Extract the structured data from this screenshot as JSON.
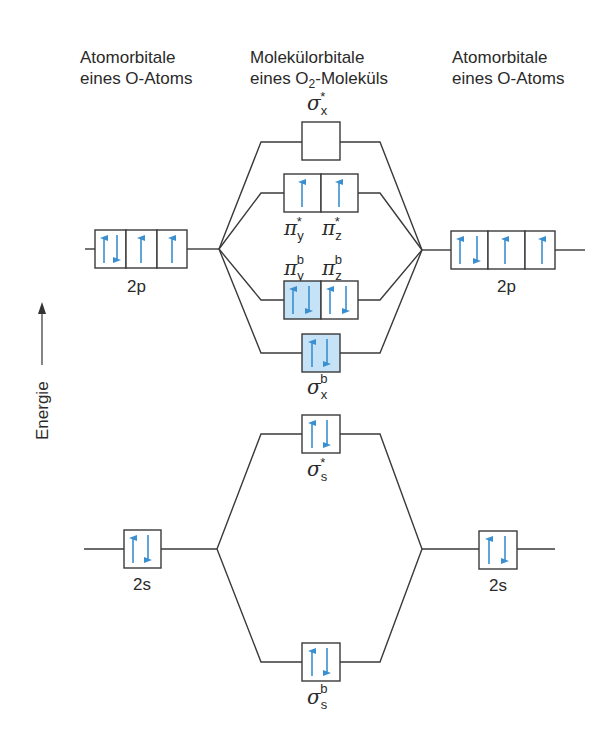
{
  "headers": {
    "left": {
      "line1": "Atomorbitale",
      "line2": "eines O-Atoms"
    },
    "middle": {
      "line1": "Molekülorbitale",
      "line2_pre": "eines O",
      "line2_sub": "2",
      "line2_post": "-Moleküls"
    },
    "right": {
      "line1": "Atomorbitale",
      "line2": "eines O-Atoms"
    }
  },
  "axis": {
    "label": "Energie",
    "direction": "up"
  },
  "colors": {
    "line": "#3a3a3a",
    "arrow": "#3a8fd0",
    "filled_box": "#c6e2f6",
    "box_border": "#3a3a3a"
  },
  "atomic_orbitals": {
    "left": [
      {
        "label": "2p",
        "boxes": [
          "up-down",
          "up",
          "up"
        ]
      },
      {
        "label": "2s",
        "boxes": [
          "up-down"
        ]
      }
    ],
    "right": [
      {
        "label": "2p",
        "boxes": [
          "up-down",
          "up",
          "up"
        ]
      },
      {
        "label": "2s",
        "boxes": [
          "up-down"
        ]
      }
    ]
  },
  "molecular_orbitals": [
    {
      "symbol": "σ",
      "sub": "x",
      "sup": "*",
      "boxes": [
        ""
      ],
      "filled": [
        false
      ]
    },
    {
      "symbol": "π",
      "labels": [
        {
          "sub": "y",
          "sup": "*"
        },
        {
          "sub": "z",
          "sup": "*"
        }
      ],
      "boxes": [
        "up",
        "up"
      ],
      "filled": [
        false,
        false
      ]
    },
    {
      "symbol": "π",
      "labels": [
        {
          "sub": "y",
          "sup": "b"
        },
        {
          "sub": "z",
          "sup": "b"
        }
      ],
      "boxes": [
        "up-down",
        "up-down"
      ],
      "filled": [
        true,
        false
      ]
    },
    {
      "symbol": "σ",
      "sub": "x",
      "sup": "b",
      "boxes": [
        "up-down"
      ],
      "filled": [
        true
      ]
    },
    {
      "symbol": "σ",
      "sub": "s",
      "sup": "*",
      "boxes": [
        "up-down"
      ],
      "filled": [
        false
      ]
    },
    {
      "symbol": "σ",
      "sub": "s",
      "sup": "b",
      "boxes": [
        "up-down"
      ],
      "filled": [
        false
      ]
    }
  ],
  "labels": {
    "sigma": "σ",
    "pi": "π",
    "x": "x",
    "y": "y",
    "z": "z",
    "s": "s",
    "star": "*",
    "b": "b",
    "p2": "2p",
    "s2": "2s"
  }
}
